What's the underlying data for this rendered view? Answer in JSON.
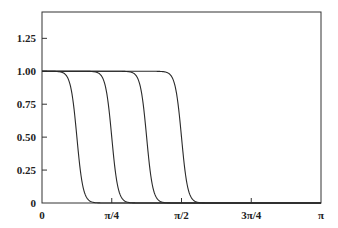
{
  "chart_data": {
    "type": "line",
    "title": "",
    "xlabel": "",
    "ylabel": "",
    "xlim": [
      0,
      3.14159
    ],
    "ylim": [
      0,
      1.45
    ],
    "grid": false,
    "legend": null,
    "x_ticks": [
      {
        "value": 0,
        "label": "0"
      },
      {
        "value": 0.785398,
        "label": "π/4"
      },
      {
        "value": 1.570796,
        "label": "π/2"
      },
      {
        "value": 2.356194,
        "label": "3π/4"
      },
      {
        "value": 3.141593,
        "label": "π"
      }
    ],
    "y_ticks": [
      {
        "value": 0,
        "label": "0"
      },
      {
        "value": 0.25,
        "label": "0.25"
      },
      {
        "value": 0.5,
        "label": "0.50"
      },
      {
        "value": 0.75,
        "label": "0.75"
      },
      {
        "value": 1.0,
        "label": "1.00"
      },
      {
        "value": 1.25,
        "label": "1.25"
      }
    ],
    "x": [
      0,
      0.0982,
      0.1963,
      0.2945,
      0.3927,
      0.4909,
      0.589,
      0.6872,
      0.7854,
      0.8836,
      0.9817,
      1.0799,
      1.1781,
      1.2763,
      1.3744,
      1.4726,
      1.5708,
      1.669,
      1.7671,
      1.8653,
      1.9635,
      2.0617,
      2.1598,
      2.258,
      2.3562,
      2.4544,
      2.5525,
      2.6507,
      2.7489,
      2.8471,
      2.9452,
      3.0434,
      3.1416
    ],
    "series": [
      {
        "name": "curve-1",
        "center": 0.3927,
        "values": [
          1,
          1,
          0.996,
          0.94,
          0.5,
          0.06,
          0.004,
          0,
          0,
          0,
          0,
          0,
          0,
          0,
          0,
          0,
          0,
          0,
          0,
          0,
          0,
          0,
          0,
          0,
          0,
          0,
          0,
          0,
          0,
          0,
          0,
          0,
          0
        ]
      },
      {
        "name": "curve-2",
        "center": 0.7854,
        "values": [
          1,
          1,
          1,
          1,
          1,
          1,
          0.996,
          0.94,
          0.5,
          0.06,
          0.004,
          0,
          0,
          0,
          0,
          0,
          0,
          0,
          0,
          0,
          0,
          0,
          0,
          0,
          0,
          0,
          0,
          0,
          0,
          0,
          0,
          0,
          0
        ]
      },
      {
        "name": "curve-3",
        "center": 1.1781,
        "values": [
          1,
          1,
          1,
          1,
          1,
          1,
          1,
          1,
          1,
          1,
          0.996,
          0.94,
          0.5,
          0.06,
          0.004,
          0,
          0,
          0,
          0,
          0,
          0,
          0,
          0,
          0,
          0,
          0,
          0,
          0,
          0,
          0,
          0,
          0,
          0
        ]
      },
      {
        "name": "curve-4",
        "center": 1.5708,
        "values": [
          1,
          1,
          1,
          1,
          1,
          1,
          1,
          1,
          1,
          1,
          1,
          1,
          1,
          1,
          0.996,
          0.94,
          0.5,
          0.06,
          0.004,
          0,
          0,
          0,
          0,
          0,
          0,
          0,
          0,
          0,
          0,
          0,
          0,
          0,
          0
        ]
      }
    ],
    "line_color": "#2a2a2a",
    "transition_width": 0.07
  },
  "plot_area": {
    "left": 42,
    "top": 12,
    "right": 321,
    "bottom": 203
  }
}
